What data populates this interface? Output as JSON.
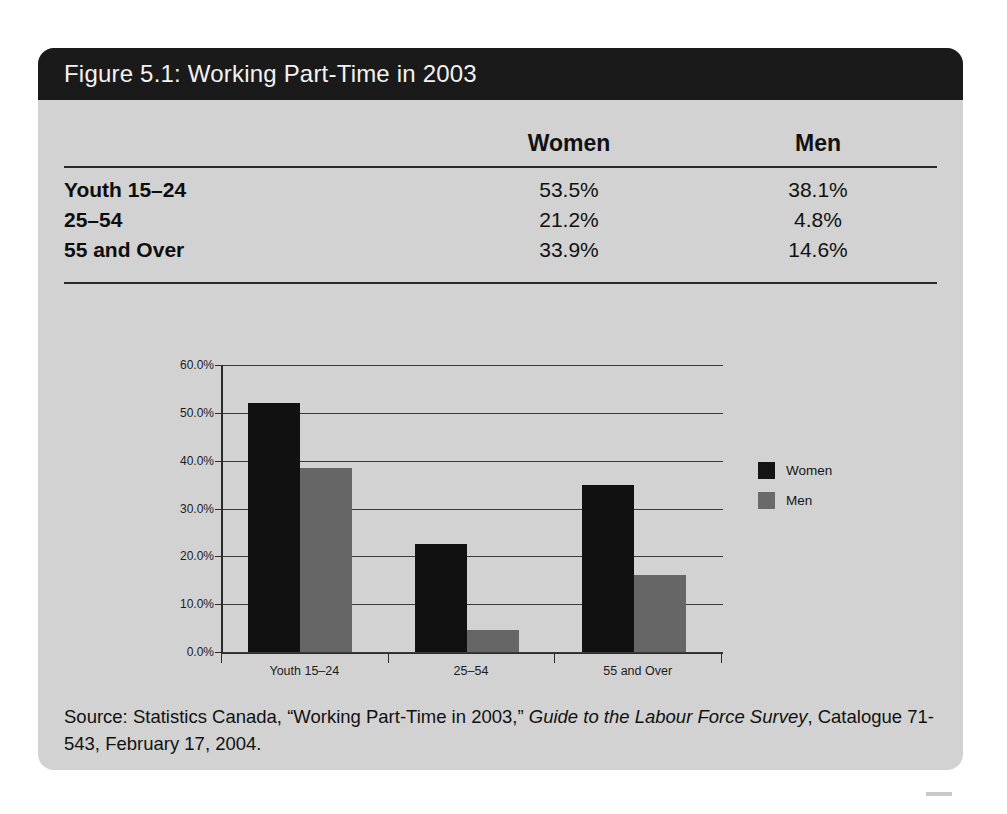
{
  "figure": {
    "title": "Figure 5.1: Working Part-Time in 2003"
  },
  "table": {
    "headers": [
      "",
      "Women",
      "Men"
    ],
    "rows": [
      {
        "label": "Youth 15–24",
        "women": "53.5%",
        "men": "38.1%"
      },
      {
        "label": "25–54",
        "women": "21.2%",
        "men": "4.8%"
      },
      {
        "label": "55 and Over",
        "women": "33.9%",
        "men": "14.6%"
      }
    ]
  },
  "chart_data": {
    "type": "bar",
    "title": "",
    "xlabel": "",
    "ylabel": "",
    "categories": [
      "Youth 15–24",
      "25–54",
      "55 and Over"
    ],
    "series": [
      {
        "name": "Women",
        "values": [
          52.0,
          22.5,
          35.0
        ],
        "color": "#111111"
      },
      {
        "name": "Men",
        "values": [
          38.5,
          4.7,
          16.0
        ],
        "color": "#666666"
      }
    ],
    "ylim": [
      0,
      60
    ],
    "yticks": [
      0,
      10,
      20,
      30,
      40,
      50,
      60
    ],
    "ytick_labels": [
      "0.0%",
      "10.0%",
      "20.0%",
      "30.0%",
      "40.0%",
      "50.0%",
      "60.0%"
    ],
    "grid": true,
    "legend_position": "right"
  },
  "legend": {
    "entries": [
      {
        "label": "Women"
      },
      {
        "label": "Men"
      }
    ]
  },
  "source": {
    "prefix": "Source: Statistics Canada, “Working Part-Time in 2003,” ",
    "italic": "Guide to the Labour Force Survey",
    "suffix": ", Catalogue 71-543, February 17, 2004."
  },
  "colors": {
    "figure_background": "#d2d2d2",
    "title_band": "#1a1a1a",
    "women_bar": "#111111",
    "men_bar": "#666666",
    "rule": "#2a2a2a"
  }
}
